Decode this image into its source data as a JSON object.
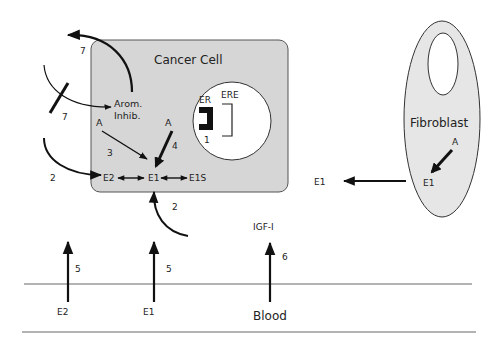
{
  "cancer_cell": {
    "title": "Cancer Cell",
    "fill": "#d6d6d6",
    "labels": {
      "arom_line1": "Arom.",
      "arom_line2": "Inhib.",
      "a_left": "A",
      "a_right": "A",
      "e2": "E2",
      "e1": "E1",
      "e1s": "E1S",
      "step3": "3",
      "step4": "4"
    },
    "nucleus": {
      "er": "ER",
      "ere": "ERE",
      "step1": "1"
    }
  },
  "outside_labels": {
    "step7_top": "7",
    "step7_inhib": "7",
    "step2_left": "2",
    "step2_bottom": "2",
    "e1_free": "E1",
    "igf": "IGF-I",
    "step6": "6",
    "step5_left": "5",
    "step5_mid": "5"
  },
  "fibroblast": {
    "title": "Fibroblast",
    "a": "A",
    "e1": "E1",
    "fill": "#e6e6e6"
  },
  "blood": {
    "label": "Blood",
    "e2": "E2",
    "e1": "E1"
  }
}
